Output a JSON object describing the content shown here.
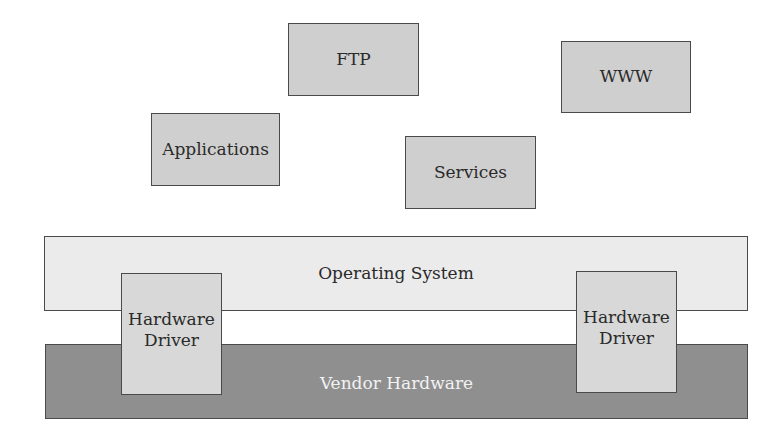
{
  "diagram": {
    "services": [
      {
        "label": "FTP"
      },
      {
        "label": "WWW"
      },
      {
        "label": "Applications"
      },
      {
        "label": "Services"
      }
    ],
    "layers": {
      "operating_system": "Operating System",
      "vendor_hardware": "Vendor Hardware"
    },
    "drivers": [
      {
        "line1": "Hardware",
        "line2": "Driver"
      },
      {
        "line1": "Hardware",
        "line2": "Driver"
      }
    ],
    "colors": {
      "service_box": "#cfcfcf",
      "os_layer": "#ebebeb",
      "vendor_layer": "#8f8f8f",
      "driver_box": "#d8d8d8",
      "border": "#4a4a4a"
    }
  }
}
